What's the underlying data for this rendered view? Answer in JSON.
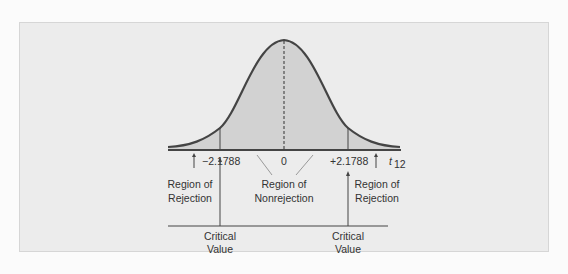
{
  "diagram": {
    "type": "t-distribution two-tailed test",
    "axis_variable": "t",
    "axis_subscript": "12",
    "tick_left": "−2.1788",
    "tick_center": "0",
    "tick_right": "+2.1788",
    "labels": {
      "left_region_line1": "Region of",
      "left_region_line2": "Rejection",
      "center_region_line1": "Region of",
      "center_region_line2": "Nonrejection",
      "right_region_line1": "Region of",
      "right_region_line2": "Rejection",
      "left_critical_line1": "Critical",
      "left_critical_line2": "Value",
      "right_critical_line1": "Critical",
      "right_critical_line2": "Value"
    },
    "colors": {
      "background": "#ececec",
      "shade": "#d2d2d2",
      "curve": "#444444",
      "text": "#333333"
    }
  }
}
